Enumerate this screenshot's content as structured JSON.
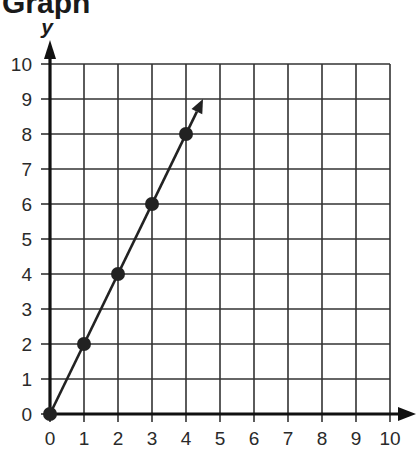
{
  "chart_data": {
    "type": "line",
    "title": "Graph",
    "xlabel": "",
    "ylabel": "y",
    "xlim": [
      0,
      10
    ],
    "ylim": [
      0,
      10
    ],
    "grid": true,
    "x_ticks": [
      "0",
      "1",
      "2",
      "3",
      "4",
      "5",
      "6",
      "7",
      "8",
      "9",
      "10"
    ],
    "y_ticks": [
      "0",
      "1",
      "2",
      "3",
      "4",
      "5",
      "6",
      "7",
      "8",
      "9",
      "10"
    ],
    "series": [
      {
        "name": "line",
        "x": [
          0,
          1,
          2,
          3,
          4
        ],
        "values": [
          0,
          2,
          4,
          6,
          8
        ],
        "markers": true,
        "arrow_end": [
          4.5,
          9
        ]
      }
    ],
    "color": "#222222"
  }
}
